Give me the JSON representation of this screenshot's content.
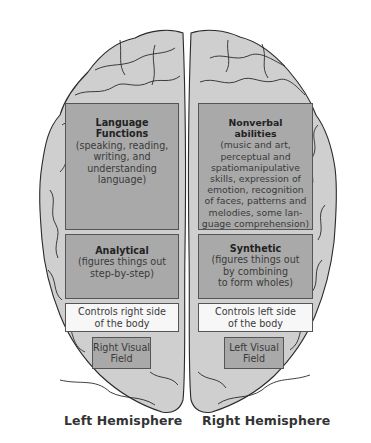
{
  "diagram": {
    "type": "brain-hemispheres-top-view",
    "colors": {
      "brain_fill": "#cfcfcf",
      "brain_outline": "#2a2a2a",
      "function_box": "#a9a9a9",
      "control_box": "#f7f7f7"
    },
    "left": {
      "label": "Left Hemisphere",
      "language": {
        "title_line1": "Language",
        "title_line2": "Functions",
        "desc": [
          "(speaking, reading,",
          "writing, and",
          "understanding",
          "language)"
        ]
      },
      "mode": {
        "title": "Analytical",
        "desc": [
          "(figures things out",
          "step-by-step)"
        ]
      },
      "controls": [
        "Controls right side",
        "of the body"
      ],
      "visual": [
        "Right Visual",
        "Field"
      ]
    },
    "right": {
      "label": "Right Hemisphere",
      "abilities": {
        "title_line1": "Nonverbal",
        "title_line2": "abilities",
        "desc": [
          "(music and art,",
          "perceptual and",
          "spatiomanipulative",
          "skills, expression of",
          "emotion, recognition",
          "of faces, patterns and",
          "melodies, some lan-",
          "guage comprehension)"
        ]
      },
      "mode": {
        "title": "Synthetic",
        "desc": [
          "(figures things out",
          "by combining",
          "to form wholes)"
        ]
      },
      "controls": [
        "Controls left side",
        "of the body"
      ],
      "visual": [
        "Left Visual",
        "Field"
      ]
    }
  }
}
